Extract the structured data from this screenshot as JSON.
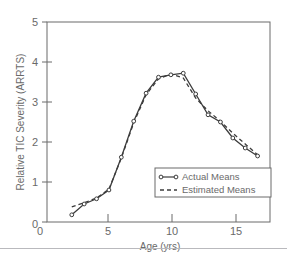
{
  "chart_data": {
    "type": "line",
    "title": "",
    "xlabel": "Age (yrs)",
    "ylabel": "Relative TIC Severity (ARRTS)",
    "xlim": [
      0,
      18
    ],
    "ylim": [
      0,
      5
    ],
    "xticks": [
      0,
      5,
      10,
      15
    ],
    "yticks": [
      0,
      1,
      2,
      3,
      4,
      5
    ],
    "xtick_labels": [
      "0",
      "5",
      "10",
      "15"
    ],
    "ytick_labels": [
      "0",
      "1",
      "2",
      "3",
      "4",
      "5"
    ],
    "grid": false,
    "legend_position": "lower right",
    "series": [
      {
        "name": "Actual Means",
        "style": "solid-with-circle-markers",
        "color": "#3c3c3c",
        "x": [
          2,
          3,
          4,
          5,
          6,
          7,
          8,
          9,
          10,
          11,
          12,
          13,
          14,
          15,
          16,
          17
        ],
        "values": [
          0.18,
          0.45,
          0.58,
          0.8,
          1.62,
          2.52,
          3.22,
          3.62,
          3.68,
          3.72,
          3.2,
          2.68,
          2.5,
          2.1,
          1.85,
          1.65
        ]
      },
      {
        "name": "Estimated Means",
        "style": "dashed",
        "color": "#3c3c3c",
        "x": [
          2,
          3,
          4,
          5,
          6,
          7,
          8,
          9,
          10,
          11,
          12,
          13,
          14,
          15,
          16,
          17
        ],
        "values": [
          0.38,
          0.48,
          0.6,
          0.82,
          1.6,
          2.48,
          3.18,
          3.58,
          3.7,
          3.6,
          3.1,
          2.78,
          2.52,
          2.22,
          1.95,
          1.68
        ]
      }
    ]
  },
  "axis": {
    "x_title": "Age (yrs)",
    "y_title": "Relative TIC Severity (ARRTS)"
  },
  "legend": {
    "entries": [
      {
        "label": "Actual Means",
        "marker": "solid-line-circle-marker"
      },
      {
        "label": "Estimated Means",
        "marker": "dashed-line"
      }
    ]
  },
  "colors": {
    "line": "#3c3c3c",
    "axis": "#6a6a6a",
    "frame": "#6a6a6a",
    "text": "#6a6a6a",
    "scan_rule": "#b9b9bd",
    "background": "#ffffff"
  }
}
